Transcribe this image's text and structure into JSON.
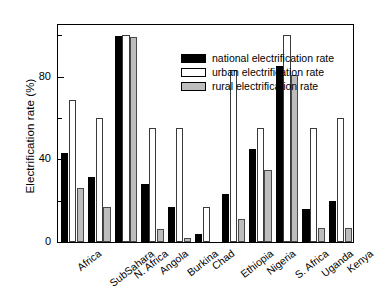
{
  "chart_data": {
    "type": "bar",
    "title": "",
    "xlabel": "",
    "ylabel": "Electrification rate (%)",
    "ylim": [
      0,
      105
    ],
    "yticks": [
      0,
      40,
      80
    ],
    "ytick_labels": [
      "0",
      "40",
      "80"
    ],
    "yminor_ticks": [
      20,
      60,
      100
    ],
    "grid": false,
    "legend_position": "top-center",
    "categories": [
      "Africa",
      "SubSahara",
      "N. Africa",
      "Angola",
      "Burkina",
      "Chad",
      "Ethiopia",
      "Nigeria",
      "S. Africa",
      "Uganda",
      "Kenya"
    ],
    "series": [
      {
        "name": "national electrification rate",
        "color": "#000000",
        "values": [
          43,
          31.5,
          99.5,
          28,
          17,
          4,
          23,
          45,
          85,
          16,
          20
        ]
      },
      {
        "name": "urban electrification rate",
        "color": "#ffffff",
        "values": [
          68.5,
          60,
          100,
          55,
          55,
          17,
          83,
          55,
          100,
          55,
          60
        ]
      },
      {
        "name": "rural electrification rate",
        "color": "#bdbdbd",
        "values": [
          26,
          17,
          99,
          6.5,
          2,
          0,
          11,
          35,
          81,
          7,
          7
        ]
      }
    ]
  }
}
